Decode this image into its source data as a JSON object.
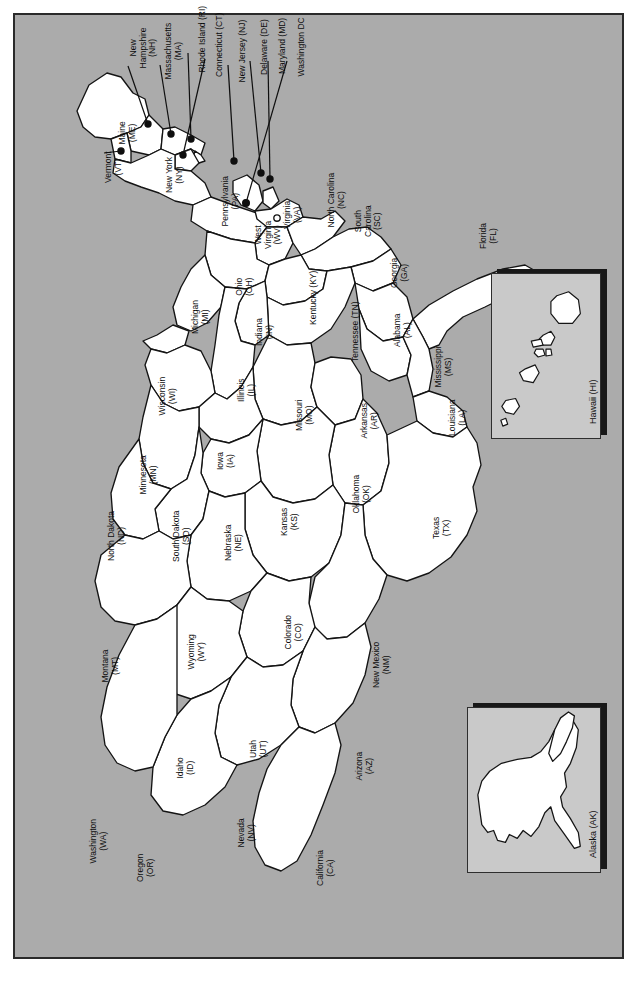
{
  "figure": {
    "kind": "map",
    "orientation_degrees": -90,
    "background_color": "#ababab",
    "land_color": "#ffffff",
    "border_color": "#1a1a1a",
    "frame_color": "#2a2a2a"
  },
  "states": [
    {
      "code": "ME",
      "name": "Maine",
      "label": "Maine\n(ME)",
      "x": 112,
      "y": 118,
      "callout": false
    },
    {
      "code": "NH",
      "name": "New Hampshire",
      "label": "New\nHampshire\n(NH)",
      "x": 128,
      "y": 33,
      "callout": true,
      "dot_x": 146,
      "dot_y": 122
    },
    {
      "code": "VT",
      "name": "Vermont",
      "label": "Vermont\n(VT)",
      "x": 98,
      "y": 152,
      "callout": true,
      "dot_x": 134,
      "dot_y": 148
    },
    {
      "code": "MA",
      "name": "Massachusetts",
      "label": "Massachusetts\n(MA)",
      "x": 158,
      "y": 36,
      "callout": true,
      "dot_x": 168,
      "dot_y": 131
    },
    {
      "code": "RI",
      "name": "Rhode Island (RI)",
      "label": "Rhode Island (RI)",
      "x": 188,
      "y": 24,
      "callout": true,
      "dot_x": 183,
      "dot_y": 136
    },
    {
      "code": "CT",
      "name": "Connecticut (CT)",
      "label": "Connecticut (CT)",
      "x": 205,
      "y": 30,
      "callout": true,
      "dot_x": 176,
      "dot_y": 152
    },
    {
      "code": "NY",
      "name": "New York",
      "label": "New York\n(NY)",
      "x": 159,
      "y": 160,
      "callout": false
    },
    {
      "code": "NJ",
      "name": "New Jersey (NJ)",
      "label": "New Jersey (NJ)",
      "x": 228,
      "y": 36,
      "callout": true,
      "dot_x": 228,
      "dot_y": 158
    },
    {
      "code": "PA",
      "name": "Pennsylvania",
      "label": "Pennsylvania\n(PA)",
      "x": 215,
      "y": 186,
      "callout": false
    },
    {
      "code": "DE",
      "name": "Delaware (DE)",
      "label": "Delaware (DE)",
      "x": 250,
      "y": 32,
      "callout": true,
      "dot_x": 254,
      "dot_y": 170
    },
    {
      "code": "MD",
      "name": "Maryland (MD)",
      "label": "Maryland (MD)",
      "x": 268,
      "y": 31,
      "callout": true,
      "dot_x": 263,
      "dot_y": 176
    },
    {
      "code": "DC",
      "name": "Washington DC",
      "label": "Washington DC",
      "x": 287,
      "y": 32,
      "callout": true,
      "dot_x": 240,
      "dot_y": 200
    },
    {
      "code": "VA",
      "name": "Virginia",
      "label": "Virginia\n(VA)",
      "x": 277,
      "y": 200,
      "callout": false
    },
    {
      "code": "WV",
      "name": "West Virginia",
      "label": "West\nVirginia\n(WV)",
      "x": 253,
      "y": 220,
      "callout": false
    },
    {
      "code": "NC",
      "name": "North Carolina",
      "label": "North Carolina\n(NC)",
      "x": 321,
      "y": 185,
      "callout": false
    },
    {
      "code": "SC",
      "name": "South Carolina",
      "label": "South\nCarolina\n(SC)",
      "x": 353,
      "y": 206,
      "callout": false
    },
    {
      "code": "GA",
      "name": "Georgia",
      "label": "Georgia\n(GA)",
      "x": 384,
      "y": 258,
      "callout": false
    },
    {
      "code": "FL",
      "name": "Florida",
      "label": "Florida\n(FL)",
      "x": 473,
      "y": 221,
      "callout": false
    },
    {
      "code": "OH",
      "name": "Ohio",
      "label": "Ohio\n(OH)",
      "x": 229,
      "y": 272,
      "callout": false
    },
    {
      "code": "KY",
      "name": "Kentucky (KY)",
      "label": "Kentucky (KY)",
      "x": 299,
      "y": 283,
      "callout": false
    },
    {
      "code": "TN",
      "name": "Tennessee (TN)",
      "label": "Tennessee (TN)",
      "x": 341,
      "y": 317,
      "callout": false
    },
    {
      "code": "AL",
      "name": "Alabama",
      "label": "Alabama\n(AL)",
      "x": 387,
      "y": 315,
      "callout": false
    },
    {
      "code": "MS",
      "name": "Mississippi",
      "label": "Mississippi\n(MS)",
      "x": 428,
      "y": 352,
      "callout": false
    },
    {
      "code": "MI",
      "name": "Michigan",
      "label": "Michigan\n(MI)",
      "x": 185,
      "y": 302,
      "callout": false
    },
    {
      "code": "IN",
      "name": "Indiana",
      "label": "Indiana\n(IN)",
      "x": 249,
      "y": 317,
      "callout": false
    },
    {
      "code": "IL",
      "name": "Illinois",
      "label": "Illinois\n(IL)",
      "x": 231,
      "y": 375,
      "callout": false
    },
    {
      "code": "WI",
      "name": "Wisconsin",
      "label": "Wisconsin\n(WI)",
      "x": 152,
      "y": 381,
      "callout": false
    },
    {
      "code": "MO",
      "name": "Missouri",
      "label": "Missouri\n(MO)",
      "x": 289,
      "y": 400,
      "callout": false
    },
    {
      "code": "AR",
      "name": "Arkansas",
      "label": "Arkansas\n(AR)",
      "x": 354,
      "y": 406,
      "callout": false
    },
    {
      "code": "LA",
      "name": "Louisiana",
      "label": "Louisiana\n(LA)",
      "x": 442,
      "y": 403,
      "callout": false
    },
    {
      "code": "IA",
      "name": "Iowa",
      "label": "Iowa\n(IA)",
      "x": 210,
      "y": 446,
      "callout": false
    },
    {
      "code": "MN",
      "name": "Minnesota",
      "label": "Minnesota\n(MN)",
      "x": 133,
      "y": 460,
      "callout": false
    },
    {
      "code": "KS",
      "name": "Kansas",
      "label": "Kansas\n(KS)",
      "x": 274,
      "y": 507,
      "callout": false
    },
    {
      "code": "OK",
      "name": "Oklahoma",
      "label": "Oklahoma\n(OK)",
      "x": 346,
      "y": 479,
      "callout": false
    },
    {
      "code": "TX",
      "name": "Texas",
      "label": "Texas\n(TX)",
      "x": 426,
      "y": 513,
      "callout": false
    },
    {
      "code": "NE",
      "name": "Nebraska",
      "label": "Nebraska\n(NE)",
      "x": 218,
      "y": 528,
      "callout": false
    },
    {
      "code": "SD",
      "name": "South Dakota",
      "label": "South Dakota\n(SD)",
      "x": 166,
      "y": 521,
      "callout": false
    },
    {
      "code": "ND",
      "name": "North Dakota",
      "label": "North Dakota\n(ND)",
      "x": 101,
      "y": 521,
      "callout": false
    },
    {
      "code": "CO",
      "name": "Colorado",
      "label": "Colorado\n(CO)",
      "x": 278,
      "y": 617,
      "callout": false
    },
    {
      "code": "NM",
      "name": "New Mexico",
      "label": "New Mexico\n(NM)",
      "x": 366,
      "y": 650,
      "callout": false
    },
    {
      "code": "WY",
      "name": "Wyoming",
      "label": "Wyoming\n(WY)",
      "x": 181,
      "y": 637,
      "callout": false
    },
    {
      "code": "MT",
      "name": "Montana",
      "label": "Montana\n(MT)",
      "x": 95,
      "y": 651,
      "callout": false
    },
    {
      "code": "UT",
      "name": "Utah",
      "label": "Utah\n(UT)",
      "x": 243,
      "y": 734,
      "callout": false
    },
    {
      "code": "AZ",
      "name": "Arizona",
      "label": "Arizona\n(AZ)",
      "x": 349,
      "y": 751,
      "callout": false
    },
    {
      "code": "ID",
      "name": "Idaho",
      "label": "Idaho\n(ID)",
      "x": 170,
      "y": 753,
      "callout": false
    },
    {
      "code": "NV",
      "name": "Nevada",
      "label": "Nevada\n(NV)",
      "x": 231,
      "y": 818,
      "callout": false
    },
    {
      "code": "CA",
      "name": "California",
      "label": "California\n(CA)",
      "x": 310,
      "y": 853,
      "callout": false
    },
    {
      "code": "WA",
      "name": "Washington",
      "label": "Washington\n(WA)",
      "x": 83,
      "y": 826,
      "callout": false
    },
    {
      "code": "OR",
      "name": "Oregon",
      "label": "Oregon\n(OR)",
      "x": 130,
      "y": 853,
      "callout": false
    }
  ],
  "insets": [
    {
      "id": "hawaii",
      "label": "Hawaii (HI)",
      "label_x": 583,
      "label_y": 355,
      "x": 490,
      "y": 272,
      "w": 110,
      "h": 166,
      "fill": "#c9c9c9"
    },
    {
      "id": "alaska",
      "label": "Alaska (AK)",
      "label_x": 585,
      "label_y": 830,
      "x": 466,
      "y": 706,
      "w": 134,
      "h": 166,
      "fill": "#c9c9c9"
    }
  ]
}
